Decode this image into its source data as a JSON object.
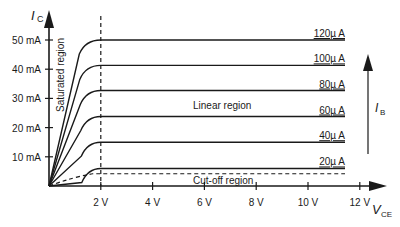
{
  "chart_data": {
    "type": "line",
    "title": "",
    "xlabel": "V",
    "xlabel_sub": "CE",
    "ylabel": "I",
    "ylabel_sub": "C",
    "x_ticks": [
      2,
      4,
      6,
      8,
      10,
      12
    ],
    "x_tick_labels": [
      "2 V",
      "4 V",
      "6 V",
      "8 V",
      "10 V",
      "12 V"
    ],
    "y_ticks": [
      10,
      20,
      30,
      40,
      50
    ],
    "y_tick_labels": [
      "10 mA",
      "20 mA",
      "30 mA",
      "40 mA",
      "50 mA"
    ],
    "xlim": [
      0,
      13.5
    ],
    "ylim": [
      0,
      55
    ],
    "series": [
      {
        "name": "20µA",
        "plateau_mA": 6.0
      },
      {
        "name": "40µA",
        "plateau_mA": 15.0
      },
      {
        "name": "60µA",
        "plateau_mA": 23.8
      },
      {
        "name": "80µA",
        "plateau_mA": 32.7
      },
      {
        "name": "100µA",
        "plateau_mA": 41.3
      },
      {
        "name": "120µA",
        "plateau_mA": 50.0
      }
    ],
    "saturation_knee_V": 2,
    "cutoff_level_mA": 4.2,
    "annotations": {
      "saturated": "Saturated region",
      "linear": "Linear region",
      "cutoff": "Cut-off region",
      "ib_arrow_label": "I",
      "ib_arrow_sub": "B"
    },
    "grid": false,
    "legend_position": "inline-right"
  }
}
